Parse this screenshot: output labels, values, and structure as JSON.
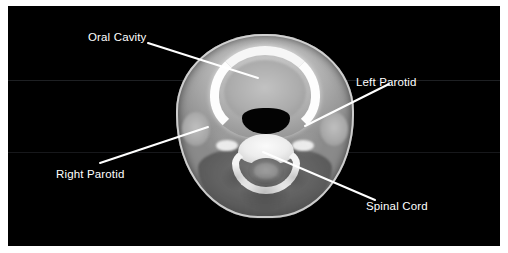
{
  "figure": {
    "kind": "axial-ct-head-slice",
    "background_color": "#ffffff",
    "scan_background_color": "#000000",
    "label_color": "#ffffff",
    "leader_line_color": "#ffffff"
  },
  "annotations": [
    {
      "id": "oral-cavity",
      "label": "Oral Cavity",
      "leader": {
        "x1": 140,
        "y1": 37,
        "x2": 250,
        "y2": 72
      }
    },
    {
      "id": "left-parotid",
      "label": "Left Parotid",
      "leader": {
        "x1": 297,
        "y1": 120,
        "x2": 381,
        "y2": 78
      }
    },
    {
      "id": "right-parotid",
      "label": "Right Parotid",
      "leader": {
        "x1": 92,
        "y1": 157,
        "x2": 200,
        "y2": 121
      }
    },
    {
      "id": "spinal-cord",
      "label": "Spinal Cord",
      "leader": {
        "x1": 255,
        "y1": 146,
        "x2": 367,
        "y2": 194
      }
    }
  ],
  "anatomy": {
    "structures": [
      "head-outline",
      "skin-rim",
      "posterior-muscle",
      "mandible",
      "oral-soft-tissue",
      "airway",
      "right-parotid-gland",
      "left-parotid-gland",
      "vertebral-body",
      "vertebral-arch",
      "transverse-process-right",
      "transverse-process-left",
      "spinal-canal",
      "spinal-cord"
    ]
  },
  "artifacts": {
    "scanlines": [
      74,
      146
    ]
  }
}
